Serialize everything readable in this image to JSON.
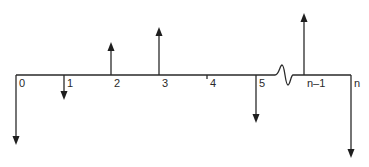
{
  "diagram": {
    "type": "cash-flow-diagram",
    "colors": {
      "stroke": "#2a2a2a",
      "background": "#ffffff"
    },
    "timeline": {
      "y": 75,
      "x_start": 16,
      "x_end": 351,
      "break_between": [
        "5",
        "n-1"
      ]
    },
    "periods": [
      {
        "label": "0",
        "x": 16,
        "flow": "down",
        "tip_y": 145
      },
      {
        "label": "1",
        "x": 64,
        "flow": "down",
        "tip_y": 100
      },
      {
        "label": "2",
        "x": 111,
        "flow": "up",
        "tip_y": 42
      },
      {
        "label": "3",
        "x": 159,
        "flow": "up",
        "tip_y": 27
      },
      {
        "label": "4",
        "x": 207,
        "flow": "none",
        "tip_y": 75
      },
      {
        "label": "5",
        "x": 256,
        "flow": "down",
        "tip_y": 123
      },
      {
        "label": "n–1",
        "x": 304,
        "flow": "up",
        "tip_y": 13
      },
      {
        "label": "n",
        "x": 351,
        "flow": "down",
        "tip_y": 158
      }
    ]
  }
}
